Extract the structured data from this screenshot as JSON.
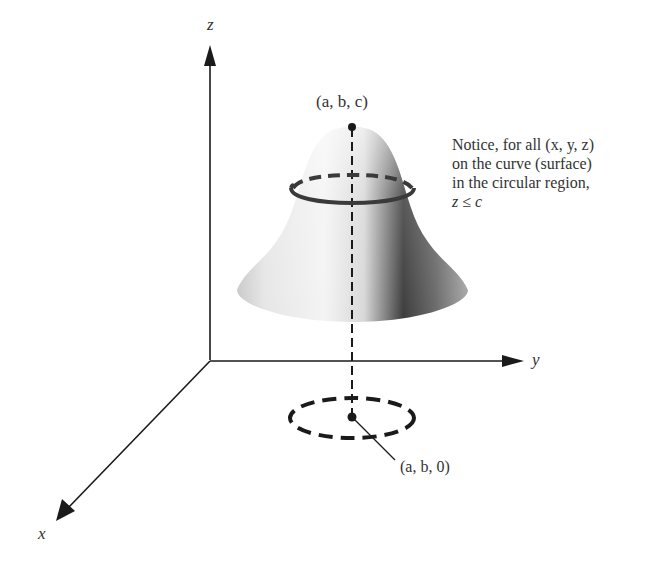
{
  "diagram": {
    "type": "3d-surface-local-maximum",
    "axes": {
      "x": "x",
      "y": "y",
      "z": "z"
    },
    "points": {
      "peak": "(a, b, c)",
      "base": "(a, b, 0)"
    },
    "note": {
      "line1": "Notice, for all (x, y, z)",
      "line2": "on the curve (surface)",
      "line3": "in the circular region,",
      "line4": "z ≤ c"
    },
    "colors": {
      "line": "#1a1a1a",
      "surface_light": "#f2f2f2",
      "surface_dark": "#3a3a3a",
      "ring": "#444444"
    }
  }
}
